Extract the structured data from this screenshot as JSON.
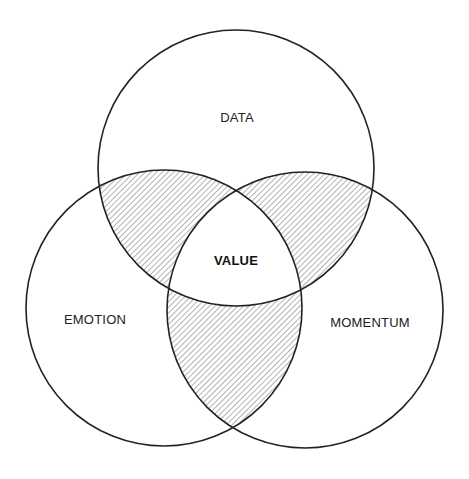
{
  "diagram": {
    "type": "venn",
    "circles": [
      {
        "id": "data",
        "label": "DATA",
        "cx": 236,
        "cy": 168,
        "r": 138,
        "label_x": 237,
        "label_y": 117
      },
      {
        "id": "emotion",
        "label": "EMOTION",
        "cx": 164,
        "cy": 308,
        "r": 138,
        "label_x": 95,
        "label_y": 319
      },
      {
        "id": "momentum",
        "label": "MOMENTUM",
        "cx": 305,
        "cy": 310,
        "r": 138,
        "label_x": 370,
        "label_y": 322
      }
    ],
    "center": {
      "label": "VALUE",
      "x": 236,
      "y": 260
    },
    "pairwise_intersections_hatched": true,
    "colors": {
      "stroke": "#222222",
      "hatch": "#8a8a8a",
      "background": "#ffffff"
    }
  }
}
